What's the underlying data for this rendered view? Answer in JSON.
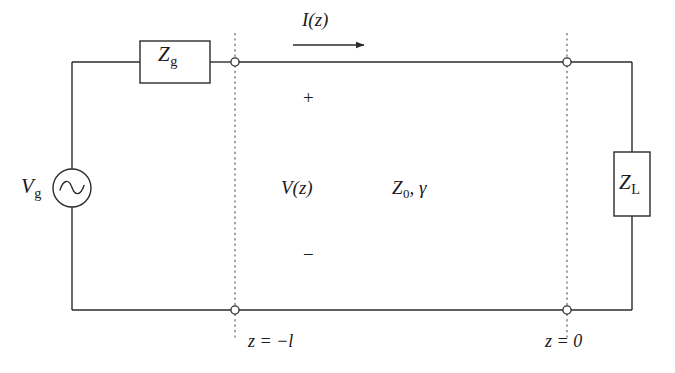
{
  "diagram": {
    "stroke_color": "#2b2b2b",
    "background_color": "#ffffff",
    "labels": {
      "generator_impedance": "Z",
      "generator_impedance_sub": "g",
      "load_impedance": "Z",
      "load_impedance_sub": "L",
      "source_voltage": "V",
      "source_voltage_sub": "g",
      "current": "I(z)",
      "voltage": "V(z)",
      "line_params": "Z",
      "line_params_sub": "0",
      "line_params_tail": ", γ",
      "polarity_plus": "+",
      "polarity_minus": "−",
      "z_left": "z = −l",
      "z_right": "z = 0"
    },
    "components": [
      {
        "name": "generator-impedance-box",
        "label": "Z_g"
      },
      {
        "name": "load-impedance-box",
        "label": "Z_L"
      },
      {
        "name": "voltage-source",
        "label": "V_g",
        "symbol": "sine-wave-circle"
      },
      {
        "name": "current-arrow",
        "label": "I(z)",
        "direction": "right"
      },
      {
        "name": "reference-plane-left",
        "label": "z = -l"
      },
      {
        "name": "reference-plane-right",
        "label": "z = 0"
      }
    ]
  }
}
